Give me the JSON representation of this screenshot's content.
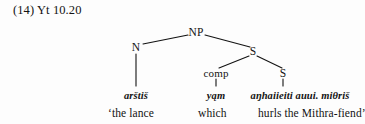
{
  "figure": {
    "label": "(14) Yt 10.20",
    "background_color": "#fdfdfd",
    "ink_color": "#131313"
  },
  "tree": {
    "nodes": [
      {
        "id": "np",
        "label": "NP",
        "x": 196,
        "y": 33
      },
      {
        "id": "n",
        "label": "N",
        "x": 136,
        "y": 48
      },
      {
        "id": "s1",
        "label": "S",
        "x": 253,
        "y": 52
      },
      {
        "id": "comp",
        "label": "comp",
        "x": 216,
        "y": 74
      },
      {
        "id": "s2",
        "label": "S",
        "x": 283,
        "y": 74
      }
    ],
    "edges": [
      {
        "from": "np",
        "to": "n",
        "type": "branch"
      },
      {
        "from": "np",
        "to": "s1",
        "type": "branch"
      },
      {
        "from": "s1",
        "to": "comp",
        "type": "branch"
      },
      {
        "from": "s1",
        "to": "s2",
        "type": "branch"
      },
      {
        "from": "n",
        "to": "term-1",
        "type": "stem"
      },
      {
        "from": "comp",
        "to": "term-2",
        "type": "stem"
      },
      {
        "from": "s2",
        "to": "term-3",
        "type": "stem"
      }
    ]
  },
  "terminals": [
    {
      "id": "term-1",
      "text": "arštiš",
      "parent": "n"
    },
    {
      "id": "term-2",
      "text": "yąm",
      "parent": "comp"
    },
    {
      "id": "term-3",
      "text": "aŋhaiieiti auui. miθriš",
      "parent": "s2"
    }
  ],
  "gloss": [
    {
      "id": "gloss-1",
      "text": "‘the lance"
    },
    {
      "id": "gloss-2",
      "text": "which"
    },
    {
      "id": "gloss-3",
      "text": "hurls the Mithra-fiend’"
    }
  ]
}
